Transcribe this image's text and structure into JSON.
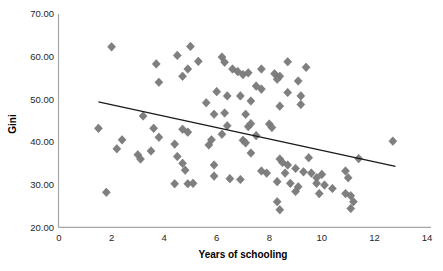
{
  "chart_data": {
    "type": "scatter",
    "title": "",
    "xlabel": "Years of schooling",
    "ylabel": "Gini",
    "xlim": [
      0,
      14
    ],
    "ylim": [
      20,
      70
    ],
    "xticks": [
      0,
      2,
      4,
      6,
      8,
      10,
      12,
      14
    ],
    "yticks": [
      20,
      30,
      40,
      50,
      60,
      70
    ],
    "ytick_labels": [
      "20.00",
      "30.00",
      "40.00",
      "50.00",
      "60.00",
      "70.00"
    ],
    "grid": false,
    "legend": "none",
    "marker": {
      "shape": "diamond",
      "color": "#7f7f7f",
      "stroke": "#6b6b6b",
      "size": 8
    },
    "axis_color": "#a6a6a6",
    "text_color": "#262626",
    "trendline": {
      "x_start": 1.5,
      "y_start": 49.4,
      "x_end": 12.8,
      "y_end": 34.3,
      "color": "#1a1a1a"
    },
    "series": [
      {
        "name": "countries",
        "points": [
          [
            2.0,
            62.3
          ],
          [
            5.0,
            62.4
          ],
          [
            6.2,
            59.9
          ],
          [
            6.3,
            58.7
          ],
          [
            3.7,
            58.3
          ],
          [
            4.5,
            60.3
          ],
          [
            5.3,
            58.9
          ],
          [
            4.9,
            57.1
          ],
          [
            4.7,
            55.4
          ],
          [
            3.8,
            54.0
          ],
          [
            6.6,
            57.1
          ],
          [
            6.8,
            56.5
          ],
          [
            7.0,
            55.8
          ],
          [
            7.2,
            56.2
          ],
          [
            7.7,
            57.1
          ],
          [
            8.2,
            56.0
          ],
          [
            8.4,
            55.4
          ],
          [
            8.3,
            54.7
          ],
          [
            8.7,
            58.8
          ],
          [
            9.4,
            57.5
          ],
          [
            9.1,
            54.3
          ],
          [
            8.7,
            51.6
          ],
          [
            9.2,
            50.8
          ],
          [
            7.5,
            53.1
          ],
          [
            7.7,
            52.4
          ],
          [
            6.0,
            51.8
          ],
          [
            6.4,
            50.8
          ],
          [
            6.9,
            50.8
          ],
          [
            5.6,
            49.2
          ],
          [
            7.3,
            49.6
          ],
          [
            8.4,
            48.4
          ],
          [
            9.2,
            48.8
          ],
          [
            3.2,
            46.1
          ],
          [
            5.9,
            46.5
          ],
          [
            6.3,
            46.8
          ],
          [
            7.1,
            46.5
          ],
          [
            1.5,
            43.2
          ],
          [
            3.6,
            43.2
          ],
          [
            3.8,
            41.1
          ],
          [
            2.4,
            40.5
          ],
          [
            2.2,
            38.4
          ],
          [
            3.0,
            37.0
          ],
          [
            3.1,
            36.0
          ],
          [
            3.5,
            37.9
          ],
          [
            4.4,
            39.5
          ],
          [
            4.5,
            36.6
          ],
          [
            4.7,
            43.0
          ],
          [
            4.9,
            42.3
          ],
          [
            6.4,
            43.8
          ],
          [
            6.2,
            41.8
          ],
          [
            5.8,
            40.5
          ],
          [
            5.7,
            39.3
          ],
          [
            7.0,
            40.4
          ],
          [
            7.1,
            39.8
          ],
          [
            7.2,
            43.6
          ],
          [
            7.3,
            44.3
          ],
          [
            8.0,
            44.2
          ],
          [
            8.1,
            43.4
          ],
          [
            7.5,
            41.5
          ],
          [
            7.3,
            37.4
          ],
          [
            11.4,
            36.1
          ],
          [
            12.7,
            40.2
          ],
          [
            1.8,
            28.2
          ],
          [
            4.7,
            35.0
          ],
          [
            4.8,
            33.4
          ],
          [
            4.4,
            30.2
          ],
          [
            4.9,
            30.2
          ],
          [
            5.1,
            30.3
          ],
          [
            5.9,
            34.6
          ],
          [
            5.9,
            32.0
          ],
          [
            6.5,
            31.4
          ],
          [
            6.9,
            31.2
          ],
          [
            7.7,
            33.2
          ],
          [
            7.9,
            32.7
          ],
          [
            8.4,
            36.0
          ],
          [
            8.5,
            35.2
          ],
          [
            9.0,
            33.8
          ],
          [
            8.7,
            34.6
          ],
          [
            8.6,
            32.7
          ],
          [
            8.3,
            30.7
          ],
          [
            8.8,
            30.3
          ],
          [
            9.1,
            29.5
          ],
          [
            9.0,
            28.4
          ],
          [
            8.3,
            26.0
          ],
          [
            8.4,
            24.1
          ],
          [
            9.5,
            36.3
          ],
          [
            9.3,
            33.0
          ],
          [
            9.6,
            32.7
          ],
          [
            9.8,
            31.6
          ],
          [
            10.0,
            32.4
          ],
          [
            9.8,
            30.3
          ],
          [
            10.1,
            29.9
          ],
          [
            10.4,
            29.1
          ],
          [
            9.9,
            27.9
          ],
          [
            10.9,
            33.2
          ],
          [
            11.0,
            31.6
          ],
          [
            10.9,
            27.9
          ],
          [
            11.1,
            27.4
          ],
          [
            11.2,
            26.0
          ],
          [
            11.1,
            24.4
          ]
        ]
      }
    ]
  }
}
